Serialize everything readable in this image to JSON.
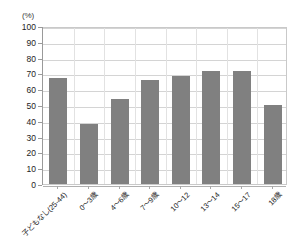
{
  "chart_data": {
    "type": "bar",
    "title": "",
    "subtitle": "",
    "xlabel": "",
    "ylabel": "",
    "unit_label": "(%)",
    "categories": [
      "子どもなし(25-44)",
      "0〜3歳",
      "4〜6歳",
      "7〜9歳",
      "10〜12",
      "13〜14",
      "15〜17",
      "18歳"
    ],
    "values": [
      67,
      38,
      54,
      66,
      68.5,
      71.5,
      71.5,
      50
    ],
    "ylim": [
      0,
      100
    ],
    "ytick_step": 10,
    "ytick_labels": [
      "100",
      "90",
      "80",
      "70",
      "60",
      "50",
      "40",
      "30",
      "20",
      "10",
      "0"
    ],
    "grid": true,
    "grid_axis": "y",
    "legend": false,
    "legend_position": "none",
    "bar_color": "#808080",
    "plot_background": "#ffffff",
    "gridline_color": "#d4d4d4",
    "axis_color": "#9a9a9a"
  }
}
